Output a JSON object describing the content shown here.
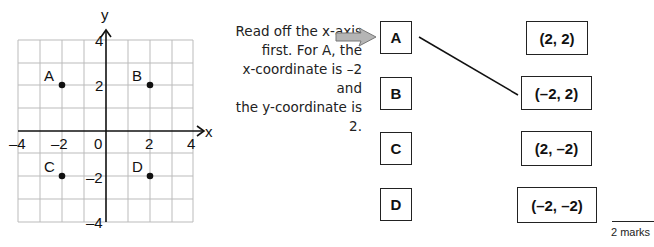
{
  "graph": {
    "axis_labels": {
      "x": "x",
      "y": "y"
    },
    "x_ticks": [
      "–4",
      "–2",
      "0",
      "2",
      "4"
    ],
    "y_ticks": [
      "4",
      "2",
      "–2",
      "–4"
    ],
    "points": [
      {
        "label": "A",
        "x": -2,
        "y": 2
      },
      {
        "label": "B",
        "x": 2,
        "y": 2
      },
      {
        "label": "C",
        "x": -2,
        "y": -2
      },
      {
        "label": "D",
        "x": 2,
        "y": -2
      }
    ]
  },
  "hint": {
    "lines": [
      "Read off the x-axis",
      "first.  For A, the",
      "x-coordinate is –2 and",
      "the y-coordinate is 2."
    ]
  },
  "matching": {
    "left": [
      "A",
      "B",
      "C",
      "D"
    ],
    "right": [
      "(2, 2)",
      "(–2, 2)",
      "(2, –2)",
      "(–2, –2)"
    ],
    "connections": [
      {
        "from": "A",
        "to": "(–2, 2)"
      }
    ]
  },
  "marks": "2 marks",
  "colors": {
    "ink": "#111111",
    "grid": "#bbbbbb",
    "arrow_fill": "#b5b5b5"
  }
}
